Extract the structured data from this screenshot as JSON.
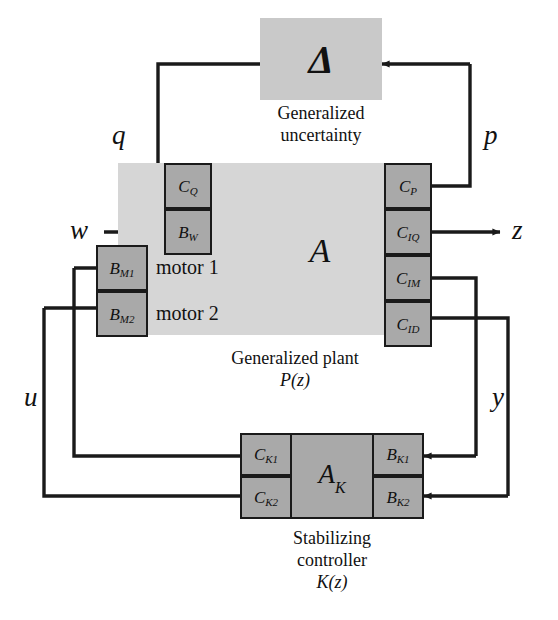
{
  "diagram": {
    "colors": {
      "plant_fill": "#d6d6d6",
      "block_fill": "#a9a9a9",
      "delta_fill": "#c9c9c9",
      "line": "#1a1a1a",
      "text": "#111111"
    }
  },
  "uncertainty": {
    "symbol": "Δ",
    "caption_line1": "Generalized",
    "caption_line2": "uncertainty"
  },
  "plant": {
    "core_symbol": "A",
    "caption_line1": "Generalized plant",
    "caption_line2": "P(z)",
    "inputs_left": [
      {
        "id": "cq",
        "base": "C",
        "sub": "Q"
      },
      {
        "id": "bw",
        "base": "B",
        "sub": "W"
      },
      {
        "id": "bm1",
        "base": "B",
        "sub": "M1"
      },
      {
        "id": "bm2",
        "base": "B",
        "sub": "M2"
      }
    ],
    "outputs_right": [
      {
        "id": "cp",
        "base": "C",
        "sub": "P"
      },
      {
        "id": "ciq",
        "base": "C",
        "sub": "IQ"
      },
      {
        "id": "cim",
        "base": "C",
        "sub": "IM"
      },
      {
        "id": "cid",
        "base": "C",
        "sub": "ID"
      }
    ],
    "annotations": [
      {
        "id": "motor1",
        "text": "motor 1"
      },
      {
        "id": "motor2",
        "text": "motor 2"
      }
    ]
  },
  "controller": {
    "core_base": "A",
    "core_sub": "K",
    "caption_line1": "Stabilizing",
    "caption_line2": "controller",
    "caption_line3": "K(z)",
    "outputs_left": [
      {
        "id": "ck1",
        "base": "C",
        "sub": "K1"
      },
      {
        "id": "ck2",
        "base": "C",
        "sub": "K2"
      }
    ],
    "inputs_right": [
      {
        "id": "bk1",
        "base": "B",
        "sub": "K1"
      },
      {
        "id": "bk2",
        "base": "B",
        "sub": "K2"
      }
    ]
  },
  "signals": [
    {
      "id": "q",
      "label": "q"
    },
    {
      "id": "p",
      "label": "p"
    },
    {
      "id": "w",
      "label": "w"
    },
    {
      "id": "z",
      "label": "z"
    },
    {
      "id": "u",
      "label": "u"
    },
    {
      "id": "y",
      "label": "y"
    }
  ]
}
